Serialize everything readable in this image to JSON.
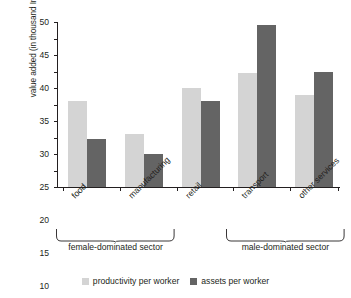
{
  "chart_data": {
    "type": "bar",
    "title": "",
    "xlabel": "",
    "ylabel": "value added (in thousand Indonesia Rupiah)",
    "ylim": [
      0,
      50
    ],
    "ytick_step": 5,
    "grid": false,
    "legend_position": "bottom",
    "categories": [
      "food",
      "manufacturing",
      "retail",
      "transport",
      "other services"
    ],
    "ytick_labels": [
      "0",
      "5",
      "10",
      "15",
      "20",
      "25",
      "30",
      "35",
      "40",
      "45",
      "50"
    ],
    "series": [
      {
        "name": "productivity per worker",
        "color": "#d4d4d4",
        "values": [
          26,
          16,
          30,
          34.5,
          28
        ]
      },
      {
        "name": "assets per worker",
        "color": "#646464",
        "values": [
          14.5,
          10,
          26,
          49,
          35
        ]
      }
    ],
    "groups": [
      {
        "label": "female-dominated sector",
        "categories": [
          "food",
          "manufacturing"
        ]
      },
      {
        "label": "male-dominated sector",
        "categories": [
          "transport",
          "other services"
        ]
      }
    ]
  }
}
